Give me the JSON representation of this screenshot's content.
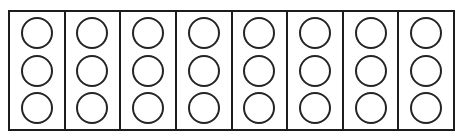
{
  "figure": {
    "shape_name": "circle",
    "columns_count": 8,
    "circles_per_column": 3,
    "total_circles": 24,
    "colors": {
      "background": "#ffffff",
      "frame_stroke": "#1c1c1c",
      "divider_stroke": "#1c1c1c",
      "circle_stroke": "#242424",
      "circle_fill": "#ffffff"
    },
    "columns": [
      {
        "index": 1,
        "label": "column-1",
        "circles": [
          "circle-1",
          "circle-2",
          "circle-3"
        ]
      },
      {
        "index": 2,
        "label": "column-2",
        "circles": [
          "circle-1",
          "circle-2",
          "circle-3"
        ]
      },
      {
        "index": 3,
        "label": "column-3",
        "circles": [
          "circle-1",
          "circle-2",
          "circle-3"
        ]
      },
      {
        "index": 4,
        "label": "column-4",
        "circles": [
          "circle-1",
          "circle-2",
          "circle-3"
        ]
      },
      {
        "index": 5,
        "label": "column-5",
        "circles": [
          "circle-1",
          "circle-2",
          "circle-3"
        ]
      },
      {
        "index": 6,
        "label": "column-6",
        "circles": [
          "circle-1",
          "circle-2",
          "circle-3"
        ]
      },
      {
        "index": 7,
        "label": "column-7",
        "circles": [
          "circle-1",
          "circle-2",
          "circle-3"
        ]
      },
      {
        "index": 8,
        "label": "column-8",
        "circles": [
          "circle-1",
          "circle-2",
          "circle-3"
        ]
      }
    ]
  }
}
